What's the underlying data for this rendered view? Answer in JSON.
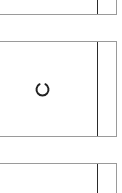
{
  "cards": [
    {
      "id": "top",
      "state": "partial"
    },
    {
      "id": "middle",
      "state": "loading",
      "icon": "loading-spinner-icon"
    },
    {
      "id": "bottom",
      "state": "partial"
    }
  ],
  "colors": {
    "background": "#ffffff",
    "border": "#9a9a9a",
    "divider": "#2a2a2a",
    "spinner": "#222222"
  }
}
